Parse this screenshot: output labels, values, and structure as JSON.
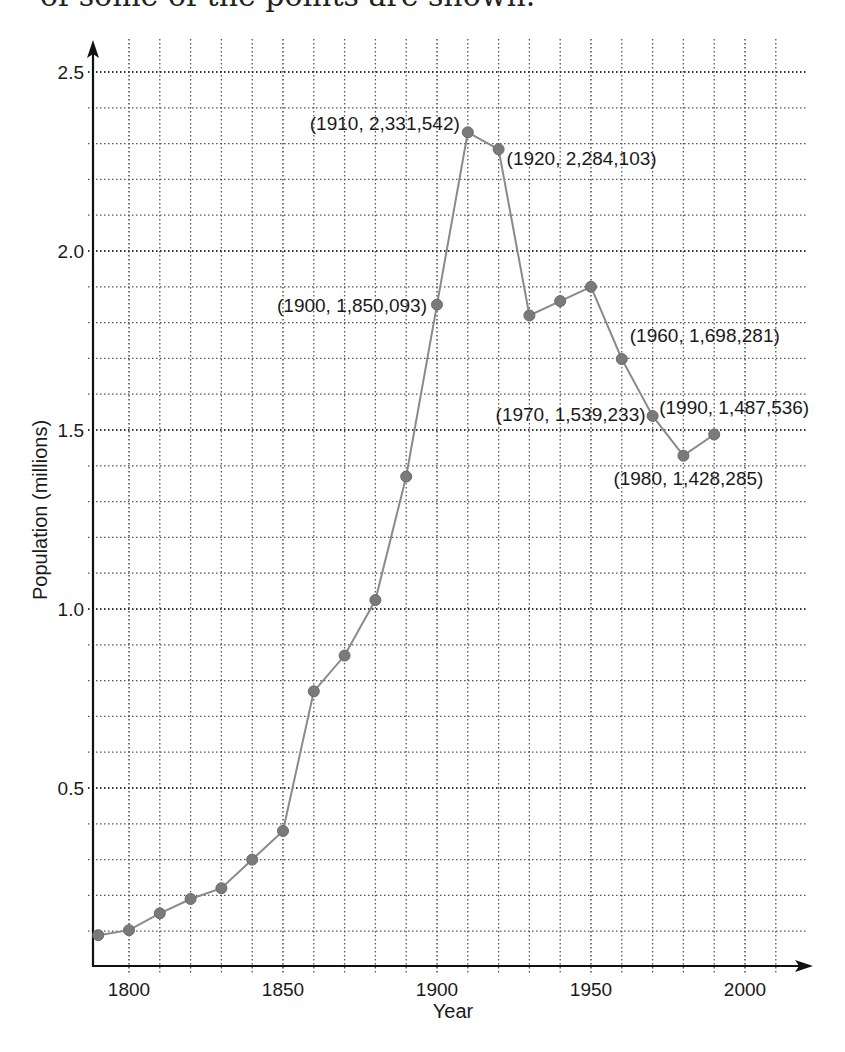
{
  "caption": "of some of the points are shown.",
  "chart_data": {
    "type": "line",
    "title": "",
    "xlabel": "Year",
    "ylabel": "Population (millions)",
    "xlim": [
      1790,
      2020
    ],
    "ylim": [
      0,
      2.6
    ],
    "grid": true,
    "x_ticks": [
      1800,
      1850,
      1900,
      1950,
      2000
    ],
    "y_ticks": [
      0.5,
      1.0,
      1.5,
      2.0,
      2.5
    ],
    "y_tick_labels": [
      "0.5",
      "1.0",
      "1.5",
      "2.0",
      "2.5"
    ],
    "x_grid_step": 10,
    "y_grid_step": 0.1,
    "series": [
      {
        "name": "Population",
        "color": "#8a8a8a",
        "marker_color": "#7a7a7a",
        "x": [
          1790,
          1800,
          1810,
          1820,
          1830,
          1840,
          1850,
          1860,
          1870,
          1880,
          1890,
          1900,
          1910,
          1920,
          1930,
          1940,
          1950,
          1960,
          1970,
          1980,
          1990
        ],
        "values": [
          0.089,
          0.103,
          0.15,
          0.19,
          0.22,
          0.3,
          0.38,
          0.77,
          0.87,
          1.025,
          1.37,
          1.850093,
          2.331542,
          2.284103,
          1.82,
          1.86,
          1.9,
          1.698281,
          1.539233,
          1.428285,
          1.487536
        ]
      }
    ],
    "annotations": [
      {
        "text": "(1900, 1,850,093)",
        "year": 1900,
        "value": 1.850093,
        "anchor": "end",
        "dx": -10,
        "dy": 7
      },
      {
        "text": "(1910, 2,331,542)",
        "year": 1910,
        "value": 2.331542,
        "anchor": "end",
        "dx": -8,
        "dy": -2
      },
      {
        "text": "(1920, 2,284,103)",
        "year": 1920,
        "value": 2.284103,
        "anchor": "start",
        "dx": 8,
        "dy": 16
      },
      {
        "text": "(1960, 1,698,281)",
        "year": 1960,
        "value": 1.698281,
        "anchor": "start",
        "dx": 8,
        "dy": -17
      },
      {
        "text": "(1970, 1,539,233)",
        "year": 1970,
        "value": 1.539233,
        "anchor": "end",
        "dx": -7,
        "dy": 5
      },
      {
        "text": "(1980, 1,428,285)",
        "year": 1980,
        "value": 1.428285,
        "anchor": "middle",
        "dx": 5,
        "dy": 29
      },
      {
        "text": "(1990, 1,487,536)",
        "year": 1990,
        "value": 1.487536,
        "anchor": "middle",
        "dx": 20,
        "dy": -20
      }
    ]
  }
}
